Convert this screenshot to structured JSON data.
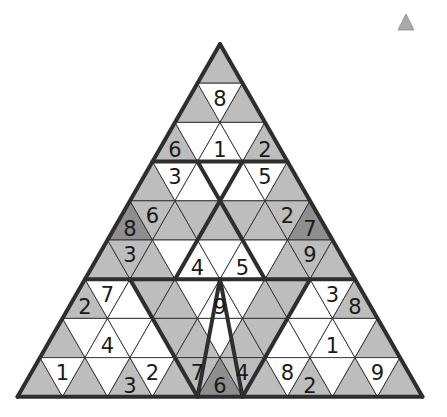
{
  "puzzle": {
    "type": "triangular-sudoku",
    "rows": 9,
    "colors": {
      "white": "#ffffff",
      "gray": "#bdbdbd",
      "dark": "#8e8e8e",
      "line": "#2e2e2e",
      "icon": "#a9a9a9"
    },
    "cells": [
      [
        [
          "gray",
          ""
        ]
      ],
      [
        [
          "gray",
          ""
        ],
        [
          "white",
          "8"
        ],
        [
          "gray",
          ""
        ]
      ],
      [
        [
          "gray",
          "6"
        ],
        [
          "white",
          ""
        ],
        [
          "white",
          "1"
        ],
        [
          "white",
          ""
        ],
        [
          "gray",
          "2"
        ]
      ],
      [
        [
          "gray",
          ""
        ],
        [
          "white",
          "3"
        ],
        [
          "white",
          ""
        ],
        [
          "white",
          ""
        ],
        [
          "white",
          ""
        ],
        [
          "white",
          "5"
        ],
        [
          "gray",
          ""
        ]
      ],
      [
        [
          "dark",
          "8"
        ],
        [
          "gray",
          "6"
        ],
        [
          "gray",
          ""
        ],
        [
          "gray",
          ""
        ],
        [
          "gray",
          ""
        ],
        [
          "gray",
          ""
        ],
        [
          "gray",
          ""
        ],
        [
          "gray",
          "2"
        ],
        [
          "dark",
          "7"
        ]
      ],
      [
        [
          "gray",
          ""
        ],
        [
          "gray",
          "3"
        ],
        [
          "gray",
          ""
        ],
        [
          "white",
          ""
        ],
        [
          "white",
          "4"
        ],
        [
          "white",
          ""
        ],
        [
          "white",
          "5"
        ],
        [
          "white",
          ""
        ],
        [
          "gray",
          ""
        ],
        [
          "gray",
          "9"
        ],
        [
          "gray",
          ""
        ]
      ],
      [
        [
          "gray",
          "2"
        ],
        [
          "white",
          "7"
        ],
        [
          "white",
          ""
        ],
        [
          "gray",
          ""
        ],
        [
          "gray",
          ""
        ],
        [
          "white",
          ""
        ],
        [
          "white",
          "9"
        ],
        [
          "white",
          ""
        ],
        [
          "gray",
          ""
        ],
        [
          "gray",
          ""
        ],
        [
          "white",
          ""
        ],
        [
          "white",
          "3"
        ],
        [
          "gray",
          "8"
        ]
      ],
      [
        [
          "gray",
          ""
        ],
        [
          "white",
          ""
        ],
        [
          "white",
          "4"
        ],
        [
          "white",
          ""
        ],
        [
          "white",
          ""
        ],
        [
          "gray",
          ""
        ],
        [
          "gray",
          ""
        ],
        [
          "white",
          ""
        ],
        [
          "gray",
          ""
        ],
        [
          "gray",
          ""
        ],
        [
          "white",
          ""
        ],
        [
          "white",
          ""
        ],
        [
          "white",
          "1"
        ],
        [
          "white",
          ""
        ],
        [
          "gray",
          ""
        ]
      ],
      [
        [
          "gray",
          ""
        ],
        [
          "white",
          "1"
        ],
        [
          "gray",
          ""
        ],
        [
          "white",
          ""
        ],
        [
          "gray",
          "3"
        ],
        [
          "white",
          "2"
        ],
        [
          "gray",
          ""
        ],
        [
          "gray",
          "7"
        ],
        [
          "dark",
          "6"
        ],
        [
          "gray",
          "4"
        ],
        [
          "gray",
          ""
        ],
        [
          "white",
          "8"
        ],
        [
          "gray",
          "2"
        ],
        [
          "white",
          ""
        ],
        [
          "gray",
          ""
        ],
        [
          "white",
          "9"
        ],
        [
          "gray",
          ""
        ]
      ]
    ]
  },
  "toolbar": {
    "corner_icon": "triangle-icon"
  }
}
